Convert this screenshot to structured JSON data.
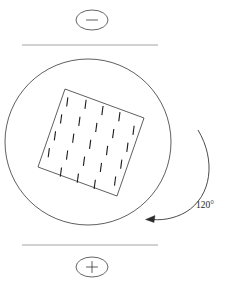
{
  "figure": {
    "background_color": "#ffffff",
    "line_color": "#1a1a1a",
    "plate_color": "#141414"
  },
  "electrodes": {
    "negative": {
      "label": "–",
      "name": "negative-terminal",
      "ellipse": {
        "cx": 92,
        "cy": 20,
        "rx": 16,
        "ry": 10
      }
    },
    "positive": {
      "label": "+",
      "name": "positive-terminal",
      "ellipse": {
        "cx": 92,
        "cy": 267,
        "rx": 16,
        "ry": 10
      }
    }
  },
  "plates": {
    "top": {
      "x1": 22,
      "y1": 45,
      "x2": 158,
      "y2": 45,
      "thickness": 2.4
    },
    "bottom": {
      "x1": 22,
      "y1": 245,
      "x2": 158,
      "y2": 245,
      "thickness": 2.4
    }
  },
  "sample": {
    "circle": {
      "cx": 88,
      "cy": 142,
      "r": 83
    },
    "crystal_square": {
      "corners": [
        {
          "x": 65,
          "y": 89
        },
        {
          "x": 144,
          "y": 118
        },
        {
          "x": 117,
          "y": 196
        },
        {
          "x": 38,
          "y": 167
        }
      ],
      "rotation_deg": 20
    },
    "domain_dashes": {
      "rows": 5,
      "columns": 5,
      "dash_length": 9,
      "description": "grid of short dashes indicating crystal domains"
    }
  },
  "rotation": {
    "angle_label": "120°",
    "label_position": {
      "x": 205,
      "y": 208
    },
    "arc": {
      "start": {
        "x": 200,
        "y": 132
      },
      "end": {
        "x": 148,
        "y": 218
      },
      "radius": 62,
      "direction": "counterclockwise"
    },
    "arrow_head": {
      "x": 146,
      "y": 219,
      "angle_deg": 200
    }
  },
  "caption": ""
}
